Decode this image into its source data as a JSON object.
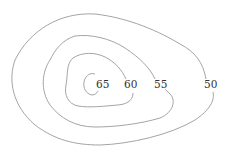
{
  "diagram": {
    "type": "contour-map",
    "line_color": "#9a9a9a",
    "text_color": "#333333",
    "contours": [
      {
        "value": 50,
        "label": "50",
        "label_pos": [
          211,
          88
        ]
      },
      {
        "value": 55,
        "label": "55",
        "label_pos": [
          161,
          88
        ]
      },
      {
        "value": 60,
        "label": "60",
        "label_pos": [
          131,
          88
        ]
      },
      {
        "value": 65,
        "label": "65",
        "label_pos": [
          103,
          88
        ]
      }
    ]
  }
}
